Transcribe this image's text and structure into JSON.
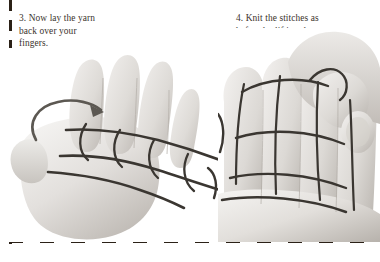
{
  "page": {
    "width": 380,
    "height": 262,
    "background": "#ffffff",
    "kind": "instructional-photo-spread",
    "topic": "finger knitting instructions"
  },
  "colors": {
    "paper": "#ffffff",
    "text": "#3b332c",
    "crop_mark": "#2b2117",
    "yarn": "#3a3631",
    "skin_light": "#e8e6e3",
    "skin_mid": "#cfcbc6",
    "skin_shadow": "#a9a49e",
    "arrow": "#5c5852"
  },
  "crop_marks": {
    "vertical": {
      "name": "left-dashed-rule",
      "x": 9,
      "dash": 11,
      "gap": 9
    },
    "horizontal": {
      "name": "bottom-dashed-rule",
      "y": 240,
      "dash": 14,
      "gap": 17
    }
  },
  "steps": [
    {
      "number": "3.",
      "caption": "3. Now lay the yarn\nback over your\nfingers.",
      "photo_alt": "Open left palm seen from the palm side with yarn looped over three fingers and a curved arrow showing the yarn being laid back over the fingers",
      "annotation": {
        "type": "curved-arrow",
        "direction": "counterclockwise-to-right"
      }
    },
    {
      "number": "4.",
      "caption": "4. Knit the stitches as\nbefore by lifting the\nyarn over your\nfingertips.",
      "photo_alt": "Fingers with two rows of yarn loops while the other hand lifts the lower loop of yarn over the fingertip",
      "annotation": {
        "type": "none",
        "direction": ""
      }
    }
  ]
}
